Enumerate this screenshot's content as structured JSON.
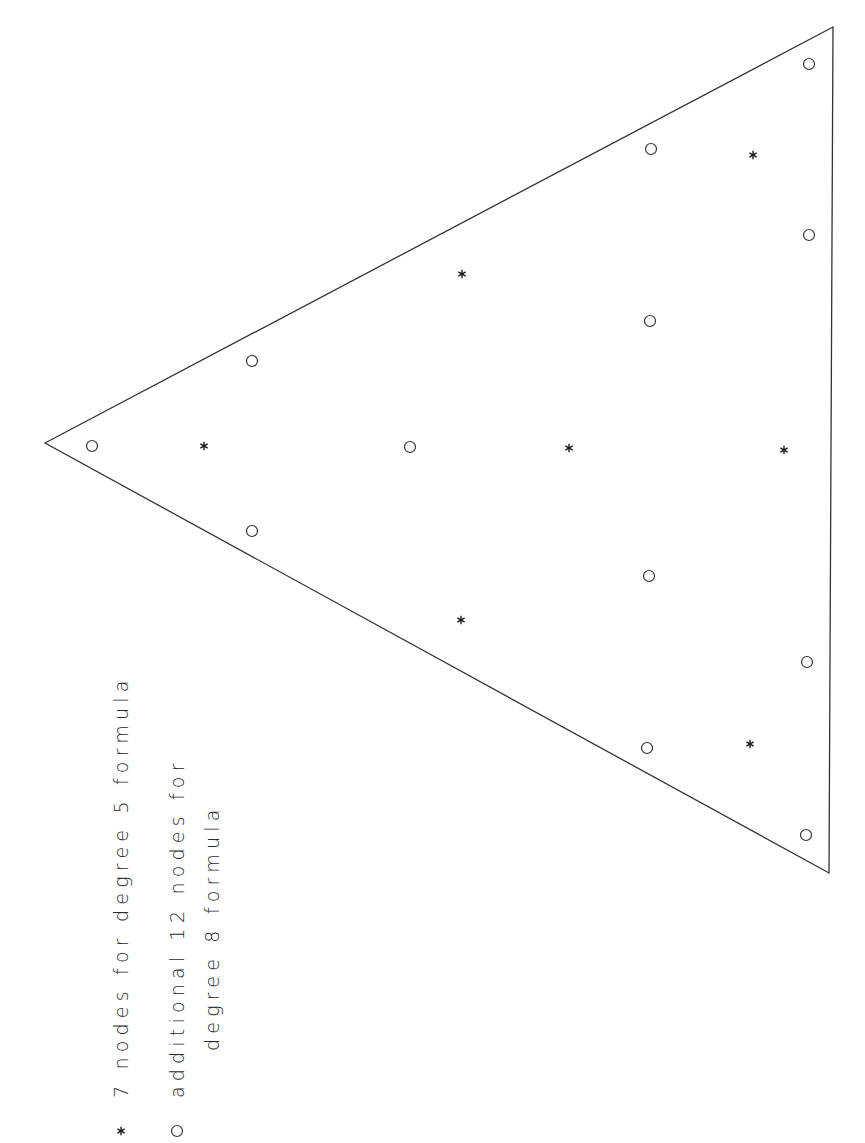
{
  "diagram": {
    "type": "triangle-quadrature-nodes",
    "stroke_color": "#333333",
    "background": "#ffffff",
    "triangle": {
      "vertices": [
        [
          45,
          443
        ],
        [
          833,
          27
        ],
        [
          829,
          873
        ]
      ]
    },
    "nodes": {
      "degree5_star": [
        {
          "x": 204,
          "y": 446
        },
        {
          "x": 462,
          "y": 274
        },
        {
          "x": 461,
          "y": 620
        },
        {
          "x": 569,
          "y": 448
        },
        {
          "x": 753,
          "y": 155
        },
        {
          "x": 784,
          "y": 450
        },
        {
          "x": 750,
          "y": 744
        }
      ],
      "degree8_additional_circle": [
        {
          "x": 92,
          "y": 446
        },
        {
          "x": 252,
          "y": 361
        },
        {
          "x": 252,
          "y": 531
        },
        {
          "x": 410,
          "y": 447
        },
        {
          "x": 651,
          "y": 149
        },
        {
          "x": 650,
          "y": 321
        },
        {
          "x": 649,
          "y": 576
        },
        {
          "x": 647,
          "y": 748
        },
        {
          "x": 809,
          "y": 64
        },
        {
          "x": 809,
          "y": 235
        },
        {
          "x": 807,
          "y": 662
        },
        {
          "x": 806,
          "y": 835
        }
      ]
    }
  },
  "legend": {
    "orientation": "rotated-90-ccw",
    "items": [
      {
        "marker": "star-icon",
        "symbol": "*",
        "line1": "7 nodes for degree 5 formula"
      },
      {
        "marker": "circle-icon",
        "symbol": "o",
        "line1": "additional 12 nodes for",
        "line2": "degree 8 formula"
      }
    ]
  }
}
